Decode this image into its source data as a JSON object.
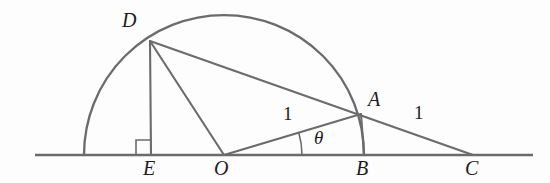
{
  "figure": {
    "type": "geometry-diagram",
    "stroke_color": "#6b6b6b",
    "label_color": "#1c1c1c",
    "background": "#fdfdfd",
    "width": 550,
    "height": 183
  },
  "points": [
    {
      "id": "D",
      "label": "D",
      "x": 150,
      "y": 41,
      "label_x": 122,
      "label_y": 10,
      "on": "semicircle"
    },
    {
      "id": "A",
      "label": "A",
      "x": 361,
      "y": 114,
      "label_x": 368,
      "label_y": 89,
      "on": "semicircle"
    },
    {
      "id": "E",
      "label": "E",
      "x": 151,
      "y": 155,
      "label_x": 143,
      "label_y": 158,
      "on": "baseline"
    },
    {
      "id": "O",
      "label": "O",
      "x": 224,
      "y": 155,
      "label_x": 214,
      "label_y": 158,
      "on": "baseline"
    },
    {
      "id": "B",
      "label": "B",
      "x": 364,
      "y": 155,
      "label_x": 356,
      "label_y": 158,
      "on": "baseline"
    },
    {
      "id": "C",
      "label": "C",
      "x": 473,
      "y": 155,
      "label_x": 465,
      "label_y": 158,
      "on": "baseline"
    }
  ],
  "semicircle": {
    "center_x": 224,
    "center_y": 155,
    "radius": 140,
    "start_x": 84,
    "end_x": 364,
    "description": "semicircle on diameter from left end to B, centered at O"
  },
  "baseline": {
    "x1": 35,
    "y1": 155,
    "x2": 533,
    "y2": 155
  },
  "segments": [
    {
      "id": "DE",
      "from": "D",
      "to": "E",
      "x1": 150,
      "y1": 41,
      "x2": 151,
      "y2": 155
    },
    {
      "id": "DO",
      "from": "D",
      "to": "O",
      "x1": 150,
      "y1": 41,
      "x2": 224,
      "y2": 155
    },
    {
      "id": "DC",
      "from": "D",
      "to": "C",
      "x1": 150,
      "y1": 41,
      "x2": 473,
      "y2": 155
    },
    {
      "id": "OA",
      "from": "O",
      "to": "A",
      "x1": 224,
      "y1": 155,
      "x2": 361,
      "y2": 114
    },
    {
      "id": "AB",
      "from": "A",
      "to": "B",
      "x1": 361,
      "y1": 114,
      "x2": 364,
      "y2": 155
    }
  ],
  "measures": [
    {
      "id": "OA-length",
      "text": "1",
      "x": 283,
      "y": 104,
      "segment": "OA"
    },
    {
      "id": "AC-length",
      "text": "1",
      "x": 414,
      "y": 103,
      "segment": "AC"
    }
  ],
  "angle": {
    "id": "theta",
    "text": "θ",
    "label_x": 314,
    "label_y": 128,
    "vertex": "O",
    "arc_radius": 78,
    "arc_start_deg": 0,
    "arc_end_deg": 16.7
  },
  "right_angle": {
    "id": "right-angle-at-E",
    "vertex": "E",
    "size": 15,
    "x": 136,
    "y": 140
  }
}
